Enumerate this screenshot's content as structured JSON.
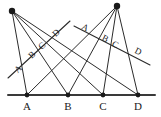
{
  "figure": {
    "canvas": {
      "width": 161,
      "height": 117
    },
    "colors": {
      "ink": "#2b2b2b",
      "baseline": "#3a3a3a",
      "dot": "#1a1a1a",
      "background": "#ffffff"
    },
    "baseline": {
      "x1": 8,
      "y1": 95,
      "x2": 155,
      "y2": 95
    },
    "apexes": [
      {
        "name": "left-apex",
        "x": 12,
        "y": 11,
        "r": 3.2
      },
      {
        "name": "right-apex",
        "x": 117,
        "y": 6,
        "r": 3.2
      }
    ],
    "base_points": [
      {
        "label": "A",
        "x": 27,
        "y": 95,
        "label_x": 27,
        "label_y": 110
      },
      {
        "label": "B",
        "x": 68,
        "y": 95,
        "label_x": 68,
        "label_y": 110
      },
      {
        "label": "C",
        "x": 103,
        "y": 95,
        "label_x": 103,
        "label_y": 110
      },
      {
        "label": "D",
        "x": 138,
        "y": 95,
        "label_x": 138,
        "label_y": 110
      }
    ],
    "left_pencil": {
      "apex": "left-apex",
      "rays": [
        {
          "to": "A",
          "x1": 12,
          "y1": 11,
          "x2": 27,
          "y2": 95
        },
        {
          "to": "B",
          "x1": 12,
          "y1": 11,
          "x2": 68,
          "y2": 95
        },
        {
          "to": "C",
          "x1": 12,
          "y1": 11,
          "x2": 103,
          "y2": 95
        },
        {
          "to": "D",
          "x1": 12,
          "y1": 11,
          "x2": 138,
          "y2": 95
        }
      ]
    },
    "right_pencil": {
      "apex": "right-apex",
      "rays": [
        {
          "to": "A",
          "x1": 117,
          "y1": 6,
          "x2": 27,
          "y2": 95
        },
        {
          "to": "B",
          "x1": 117,
          "y1": 6,
          "x2": 68,
          "y2": 95
        },
        {
          "to": "C",
          "x1": 117,
          "y1": 6,
          "x2": 103,
          "y2": 95
        },
        {
          "to": "D",
          "x1": 117,
          "y1": 6,
          "x2": 138,
          "y2": 95
        }
      ]
    },
    "transversals": [
      {
        "name": "left-transversal",
        "x1": 8,
        "y1": 78,
        "x2": 70,
        "y2": 21,
        "cut_labels": [
          {
            "label": "A",
            "x": 20,
            "y": 71,
            "rotate": -44
          },
          {
            "label": "B",
            "x": 34,
            "y": 57,
            "rotate": -44
          },
          {
            "label": "C",
            "x": 44,
            "y": 48,
            "rotate": -44
          },
          {
            "label": "D",
            "x": 58,
            "y": 35,
            "rotate": -44
          }
        ]
      },
      {
        "name": "right-transversal",
        "x1": 74,
        "y1": 26,
        "x2": 150,
        "y2": 65,
        "cut_labels": [
          {
            "label": "A",
            "x": 84,
            "y": 30,
            "rotate": 27
          },
          {
            "label": "B",
            "x": 104,
            "y": 41,
            "rotate": 27
          },
          {
            "label": "C",
            "x": 114,
            "y": 47,
            "rotate": 27
          },
          {
            "label": "D",
            "x": 137,
            "y": 54,
            "rotate": 27
          }
        ]
      }
    ]
  }
}
